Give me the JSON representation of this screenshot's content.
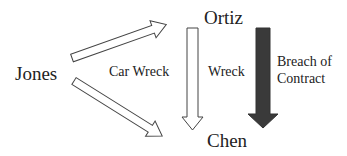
{
  "diagram": {
    "nodes": [
      {
        "id": "jones",
        "label": "Jones"
      },
      {
        "id": "ortiz",
        "label": "Ortiz"
      },
      {
        "id": "chen",
        "label": "Chen"
      }
    ],
    "edge_labels": {
      "car_wreck": "Car Wreck",
      "wreck": "Wreck",
      "breach_line1": "Breach of",
      "breach_line2": "Contract"
    },
    "edges": [
      {
        "from": "jones",
        "to": "ortiz",
        "style": "hollow",
        "label": "Car Wreck"
      },
      {
        "from": "jones",
        "to": "chen",
        "style": "hollow",
        "label": "Car Wreck"
      },
      {
        "from": "ortiz",
        "to": "chen",
        "style": "hollow",
        "label": "Wreck"
      },
      {
        "from": "ortiz",
        "to": "chen",
        "style": "filled",
        "label": "Breach of Contract"
      }
    ],
    "colors": {
      "hollow_stroke": "#444444",
      "filled_arrow": "#3a3a3a",
      "text": "#222222"
    }
  }
}
